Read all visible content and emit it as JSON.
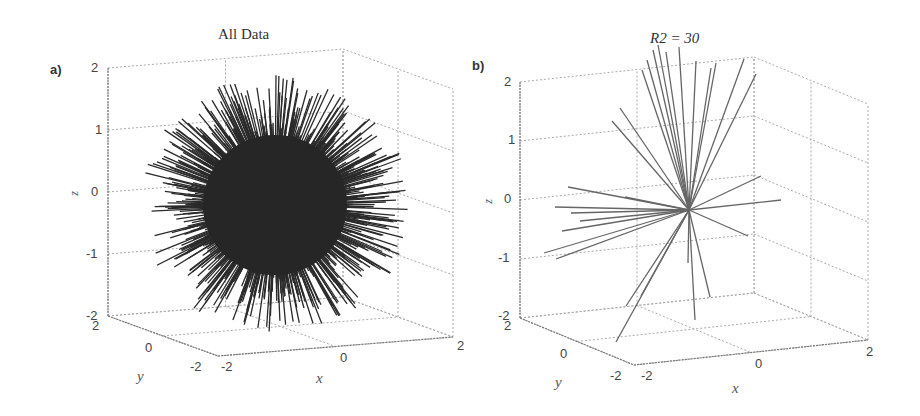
{
  "chart_data": [
    {
      "type": "3d-line",
      "panel_label": "a)",
      "title": "All Data",
      "xlabel": "x",
      "ylabel": "y",
      "zlabel": "z",
      "xlim": [
        -2,
        2
      ],
      "ylim": [
        -2,
        2
      ],
      "zlim": [
        -2,
        2
      ],
      "xticks": [
        "-2",
        "0",
        "2"
      ],
      "yticks": [
        "-2",
        "0",
        "2"
      ],
      "zticks": [
        "-2",
        "-1",
        "0",
        "1",
        "2"
      ],
      "grid": true,
      "description": "Dense set of radial line segments from the origin forming a spiky sphere of radius ~1-1.6",
      "line_color": "#2a2a2a"
    },
    {
      "type": "3d-line",
      "panel_label": "b)",
      "title": "R2 = 30",
      "xlabel": "x",
      "ylabel": "y",
      "zlabel": "z",
      "xlim": [
        -2,
        2
      ],
      "ylim": [
        -2,
        2
      ],
      "zlim": [
        -2,
        2
      ],
      "xticks": [
        "-2",
        "0",
        "2"
      ],
      "yticks": [
        "-2",
        "0",
        "2"
      ],
      "zticks": [
        "-2",
        "-1",
        "0",
        "1",
        "2"
      ],
      "grid": true,
      "description": "About 30 radial line segments from the origin",
      "num_lines": 30,
      "line_color": "#666666"
    }
  ],
  "panels": {
    "a": {
      "tag": "a)",
      "title": "All Data",
      "zticks": [
        "2",
        "1",
        "0",
        "-1",
        "-2"
      ],
      "yticks": [
        "2",
        "0",
        "-2"
      ],
      "xticks": [
        "-2",
        "0",
        "2"
      ],
      "xlabel": "x",
      "ylabel": "y",
      "zlabel": "z"
    },
    "b": {
      "tag": "b)",
      "title": "R2 = 30",
      "zticks": [
        "2",
        "1",
        "0",
        "-1",
        "-2"
      ],
      "yticks": [
        "2",
        "0",
        "-2"
      ],
      "xticks": [
        "-2",
        "0",
        "2"
      ],
      "xlabel": "x",
      "ylabel": "y",
      "zlabel": "z"
    }
  }
}
